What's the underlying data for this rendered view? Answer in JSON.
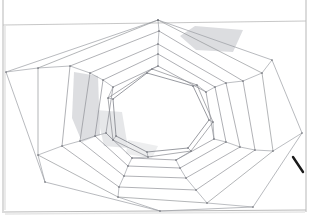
{
  "document": {
    "title": "Hand-drawn nested rotating heptagons",
    "medium": "pencil on paper",
    "canvas_width": 321,
    "canvas_height": 220,
    "background_color": "#ffffff"
  },
  "colors": {
    "paper": "#ffffff",
    "paper_edge": "#b9b9b9",
    "pencil_line": "#8d8f96",
    "pencil_line_faint": "#b2b4ba",
    "pencil_line_dark": "#6f717a",
    "vertex_dot": "#6a6c74",
    "shading": "#cfd0d4",
    "dark_mark": "#1a1a1a",
    "shadow_edge": "#d4d4d4"
  },
  "paper": {
    "name": "sheet-of-paper",
    "top_edge_y": 23,
    "bottom_edge_y": 212,
    "left_edge_x": 3,
    "right_edge_x": 306,
    "top_edge_left_y": 25,
    "top_edge_right_y": 21
  },
  "figure": {
    "name": "nested-rotating-heptagon-spiral",
    "sides": 7,
    "ring_count": 8,
    "center": {
      "x": 158,
      "y": 113
    },
    "rings": [
      {
        "index": 0,
        "label": "outermost-heptagon",
        "stroke_color": "#9a9ca2",
        "stroke_width": 0.7,
        "points": [
          [
            158,
            20
          ],
          [
            272,
            60
          ],
          [
            302,
            133
          ],
          [
            253,
            207
          ],
          [
            160,
            211
          ],
          [
            45,
            182
          ],
          [
            6,
            72
          ]
        ]
      },
      {
        "index": 1,
        "label": "heptagon-2",
        "stroke_color": "#949699",
        "stroke_width": 0.7,
        "points": [
          [
            158,
            20
          ],
          [
            262,
            73
          ],
          [
            273,
            151
          ],
          [
            207,
            203
          ],
          [
            118,
            197
          ],
          [
            38,
            155
          ],
          [
            38,
            68
          ]
        ]
      },
      {
        "index": 2,
        "label": "heptagon-3",
        "stroke_color": "#8f9196",
        "stroke_width": 0.7,
        "points": [
          [
            159,
            31
          ],
          [
            243,
            81
          ],
          [
            255,
            150
          ],
          [
            196,
            190
          ],
          [
            119,
            187
          ],
          [
            62,
            146
          ],
          [
            70,
            66
          ]
        ]
      },
      {
        "index": 3,
        "label": "heptagon-4",
        "stroke_color": "#8f9196",
        "stroke_width": 0.7,
        "points": [
          [
            158,
            44
          ],
          [
            226,
            83
          ],
          [
            240,
            147
          ],
          [
            186,
            178
          ],
          [
            124,
            176
          ],
          [
            80,
            141
          ],
          [
            90,
            73
          ]
        ]
      },
      {
        "index": 4,
        "label": "heptagon-5",
        "stroke_color": "#8b8d93",
        "stroke_width": 0.7,
        "points": [
          [
            158,
            54
          ],
          [
            215,
            87
          ],
          [
            226,
            142
          ],
          [
            180,
            168
          ],
          [
            128,
            166
          ],
          [
            95,
            136
          ],
          [
            103,
            80
          ]
        ]
      },
      {
        "index": 5,
        "label": "heptagon-6",
        "stroke_color": "#8b8d93",
        "stroke_width": 0.7,
        "points": [
          [
            158,
            66
          ],
          [
            206,
            92
          ],
          [
            214,
            139
          ],
          [
            176,
            160
          ],
          [
            132,
            158
          ],
          [
            106,
            133
          ],
          [
            113,
            87
          ]
        ]
      },
      {
        "index": 6,
        "label": "heptagon-7",
        "stroke_color": "#86888e",
        "stroke_width": 0.7,
        "points": [
          [
            152,
            69
          ],
          [
            197,
            85
          ],
          [
            213,
            122
          ],
          [
            191,
            151
          ],
          [
            148,
            157
          ],
          [
            113,
            140
          ],
          [
            108,
            98
          ]
        ]
      },
      {
        "index": 7,
        "label": "innermost-heptagon",
        "stroke_color": "#7f8189",
        "stroke_width": 0.8,
        "points": [
          [
            147,
            73
          ],
          [
            193,
            86
          ],
          [
            209,
            120
          ],
          [
            188,
            148
          ],
          [
            147,
            152
          ],
          [
            116,
            136
          ],
          [
            113,
            99
          ]
        ]
      }
    ],
    "connector_note": "Each vertex of a ring is joined by a straight line to the corresponding vertex of the next inner ring, producing the pinwheel spiral effect"
  },
  "shading_patches": [
    {
      "name": "shading-patch-upper-right",
      "color": "#d0d1d5",
      "opacity": 0.75,
      "points": [
        [
          195,
          26
        ],
        [
          243,
          30
        ],
        [
          233,
          52
        ],
        [
          196,
          50
        ],
        [
          180,
          36
        ]
      ]
    },
    {
      "name": "shading-patch-left-middle",
      "color": "#cfd0d4",
      "opacity": 0.7,
      "points": [
        [
          74,
          72
        ],
        [
          98,
          76
        ],
        [
          100,
          135
        ],
        [
          82,
          142
        ],
        [
          72,
          118
        ]
      ]
    },
    {
      "name": "shading-patch-left-lower",
      "color": "#d6d7da",
      "opacity": 0.6,
      "points": [
        [
          96,
          110
        ],
        [
          122,
          112
        ],
        [
          128,
          148
        ],
        [
          104,
          146
        ]
      ]
    },
    {
      "name": "shading-patch-center-low",
      "color": "#dcdde0",
      "opacity": 0.5,
      "points": [
        [
          128,
          140
        ],
        [
          158,
          146
        ],
        [
          152,
          158
        ],
        [
          126,
          154
        ]
      ]
    }
  ],
  "marks": [
    {
      "name": "dark-pen-stroke-right-edge",
      "description": "short dark diagonal stroke near right paper edge",
      "color": "#1a1a1a",
      "x1": 293,
      "y1": 157,
      "x2": 303,
      "y2": 172,
      "stroke_width": 2.4
    }
  ]
}
